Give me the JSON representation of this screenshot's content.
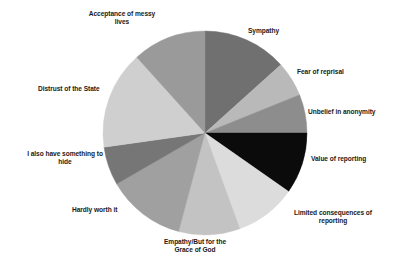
{
  "chart_data": {
    "type": "pie",
    "title": "",
    "subtitle": "",
    "xlabel": "",
    "ylabel": "",
    "legend_position": "none",
    "labels_position": "outside-callout",
    "grid": false,
    "total": 100,
    "categories": [
      "Sympathy",
      "Fear of reprisal",
      "Unbelief in anonymity",
      "Value of reporting",
      "Limited consequences of reporting",
      "Empathy/But for the Grace of God",
      "Hardly worth it",
      "I also have something to hide",
      "Distrust of the State",
      "Acceptance of messy lives"
    ],
    "values": [
      13.3,
      5.6,
      6.1,
      9.7,
      9.7,
      9.7,
      12.5,
      6.1,
      15.6,
      11.7
    ],
    "slices": [
      {
        "label": "Sympathy",
        "value": 13.3,
        "start_deg": 0,
        "end_deg": 48,
        "color": "#707070"
      },
      {
        "label": "Fear of reprisal",
        "value": 5.6,
        "start_deg": 48,
        "end_deg": 68,
        "color": "#b9b9b9"
      },
      {
        "label": "Unbelief in anonymity",
        "value": 6.1,
        "start_deg": 68,
        "end_deg": 90,
        "color": "#8d8d8d"
      },
      {
        "label": "Value of reporting",
        "value": 9.7,
        "start_deg": 90,
        "end_deg": 125,
        "color": "#0b0b0b"
      },
      {
        "label": "Limited consequences of reporting",
        "value": 9.7,
        "start_deg": 125,
        "end_deg": 160,
        "color": "#dcdcdc"
      },
      {
        "label": "Empathy/But for the Grace of God",
        "value": 9.7,
        "start_deg": 160,
        "end_deg": 195,
        "color": "#c3c3c3"
      },
      {
        "label": "Hardly worth it",
        "value": 12.5,
        "start_deg": 195,
        "end_deg": 240,
        "color": "#a0a0a0"
      },
      {
        "label": "I also have something to hide",
        "value": 6.1,
        "start_deg": 240,
        "end_deg": 262,
        "color": "#767676"
      },
      {
        "label": "Distrust of the State",
        "value": 15.6,
        "start_deg": 262,
        "end_deg": 318,
        "color": "#cfcfcf"
      },
      {
        "label": "Acceptance of messy lives",
        "value": 11.7,
        "start_deg": 318,
        "end_deg": 360,
        "color": "#9a9a9a"
      }
    ],
    "geometry": {
      "cx": 205,
      "cy": 133,
      "radius": 102
    },
    "colors": {
      "background": "#ffffff",
      "label_text": "#1a1a1a",
      "darkest_slice": "#0b0b0b",
      "lightest_slice": "#dcdcdc"
    }
  },
  "labels": {
    "acceptance_of_messy_lives": "Acceptance of messy\nlives",
    "sympathy": "Sympathy",
    "fear_of_reprisal": "Fear of reprisal",
    "unbelief_in_anonymity": "Unbelief in anonymity",
    "value_of_reporting": "Value of reporting",
    "limited_consequences_of_reporting": "Limited consequences of\nreporting",
    "empathy_but_for_the_grace_of_god": "Empathy/But for the\nGrace of God",
    "hardly_worth_it": "Hardly worth it",
    "i_also_have_something_to_hide": "I also have something to\nhide",
    "distrust_of_the_state": "Distrust of the State"
  }
}
